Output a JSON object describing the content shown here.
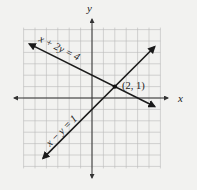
{
  "chart_data": {
    "type": "line",
    "title": "",
    "xlabel": "x",
    "ylabel": "y",
    "xlim": [
      -6,
      6
    ],
    "ylim": [
      -6,
      6
    ],
    "grid": true,
    "unit_px": 11.4,
    "origin_px": [
      92,
      98
    ],
    "series": [
      {
        "name": "x + 2y = 4",
        "label": "x + 2y = 4",
        "equation": "x + 2y = 4",
        "x": [
          -5.5,
          5.5
        ],
        "y": [
          4.75,
          -0.75
        ],
        "arrows": "both"
      },
      {
        "name": "x − y = 1",
        "label": "x − y = 1",
        "equation": "x - y = 1",
        "x": [
          -4.3,
          5.5
        ],
        "y": [
          -5.3,
          4.5
        ],
        "arrows": "both"
      }
    ],
    "annotations": [
      {
        "type": "point",
        "x": 2,
        "y": 1,
        "text": "(2, 1)"
      }
    ]
  },
  "labels": {
    "x_axis": "x",
    "y_axis": "y",
    "line1": "x + 2y = 4",
    "line2": "x − y = 1",
    "intersection": "(2, 1)"
  },
  "colors": {
    "background": "#f2f2f0",
    "grid": "#b8b8b8",
    "axis": "#333333",
    "line": "#1a1a1a"
  }
}
